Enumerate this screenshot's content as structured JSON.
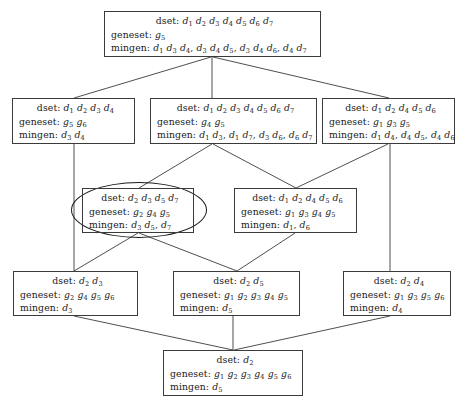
{
  "diagram": {
    "labels": {
      "dset": "dset:",
      "geneset": "geneset:",
      "mingen": "mingen:"
    },
    "stroke_color": "#3b3b3b",
    "highlight_color": "#1a1a1a",
    "background_color": "#ffffff"
  },
  "nodes": [
    {
      "id": "n0",
      "name": "node-top",
      "x": 104,
      "y": 11,
      "w": 217,
      "h": 46,
      "dset": "d1 d2 d3 d4 d5 d6 d7",
      "geneset": "g5",
      "mingen": "d1 d3 d4, d3 d4 d5, d3 d4 d6, d4 d7",
      "highlighted": false
    },
    {
      "id": "n1",
      "name": "node-row2-left",
      "x": 12,
      "y": 98,
      "w": 123,
      "h": 46,
      "dset": "d1 d2 d3 d4",
      "geneset": "g5 g6",
      "mingen": "d3 d4",
      "highlighted": false
    },
    {
      "id": "n2",
      "name": "node-row2-middle",
      "x": 150,
      "y": 98,
      "w": 167,
      "h": 46,
      "dset": "d1 d2 d3 d4 d5 d6 d7",
      "geneset": "g4 g5",
      "mingen": "d1 d3, d1 d7, d3 d6, d6 d7",
      "highlighted": false
    },
    {
      "id": "n3",
      "name": "node-row2-right",
      "x": 322,
      "y": 98,
      "w": 133,
      "h": 46,
      "dset": "d1 d2 d4 d5 d6",
      "geneset": "g1 g3 g5",
      "mingen": "d1 d4, d4 d5, d4 d6",
      "highlighted": false
    },
    {
      "id": "n4",
      "name": "node-row3-left-highlighted",
      "x": 82,
      "y": 188,
      "w": 112,
      "h": 45,
      "dset": "d2 d3 d5 d7",
      "geneset": "g2 g4 g5",
      "mingen": "d3 d5, d7",
      "highlighted": true
    },
    {
      "id": "n5",
      "name": "node-row3-right",
      "x": 234,
      "y": 188,
      "w": 123,
      "h": 45,
      "dset": "d1 d2 d4 d5 d6",
      "geneset": "g1 g3 g4 g5",
      "mingen": "d1, d6",
      "highlighted": false
    },
    {
      "id": "n6",
      "name": "node-row4-left",
      "x": 13,
      "y": 271,
      "w": 125,
      "h": 45,
      "dset": "d2 d3",
      "geneset": "g2 g4 g5 g6",
      "mingen": "d3",
      "highlighted": false
    },
    {
      "id": "n7",
      "name": "node-row4-middle",
      "x": 173,
      "y": 271,
      "w": 127,
      "h": 45,
      "dset": "d2 d5",
      "geneset": "g1 g2 g3 g4 g5",
      "mingen": "d5",
      "highlighted": false
    },
    {
      "id": "n8",
      "name": "node-row4-right",
      "x": 343,
      "y": 271,
      "w": 108,
      "h": 45,
      "dset": "d2 d4",
      "geneset": "g1 g3 g5 g6",
      "mingen": "d4",
      "highlighted": false
    },
    {
      "id": "n9",
      "name": "node-bottom",
      "x": 163,
      "y": 350,
      "w": 140,
      "h": 46,
      "dset": "d2",
      "geneset": "g1 g2 g3 g4 g5 g6",
      "mingen": "d5",
      "highlighted": false
    }
  ],
  "edges": [
    {
      "name": "edge-top-to-row2-left",
      "x1": 211,
      "y1": 57,
      "x2": 74,
      "y2": 98
    },
    {
      "name": "edge-top-to-row2-middle",
      "x1": 212,
      "y1": 57,
      "x2": 212,
      "y2": 98
    },
    {
      "name": "edge-top-to-row2-right",
      "x1": 213,
      "y1": 57,
      "x2": 389,
      "y2": 98
    },
    {
      "name": "edge-row2left-to-row4left",
      "x1": 74,
      "y1": 144,
      "x2": 74,
      "y2": 271
    },
    {
      "name": "edge-row2mid-to-highlight",
      "x1": 212,
      "y1": 144,
      "x2": 139,
      "y2": 188
    },
    {
      "name": "edge-row2mid-to-row3right",
      "x1": 213,
      "y1": 144,
      "x2": 296,
      "y2": 188
    },
    {
      "name": "edge-row2right-to-row3right",
      "x1": 388,
      "y1": 144,
      "x2": 296,
      "y2": 188
    },
    {
      "name": "edge-row2right-to-row4right",
      "x1": 390,
      "y1": 144,
      "x2": 390,
      "y2": 271
    },
    {
      "name": "edge-highlight-to-row4left",
      "x1": 138,
      "y1": 233,
      "x2": 74,
      "y2": 271
    },
    {
      "name": "edge-highlight-to-row4mid",
      "x1": 139,
      "y1": 233,
      "x2": 237,
      "y2": 271
    },
    {
      "name": "edge-row3right-to-row4mid",
      "x1": 295,
      "y1": 233,
      "x2": 237,
      "y2": 271
    },
    {
      "name": "edge-row4left-to-bottom",
      "x1": 74,
      "y1": 316,
      "x2": 233,
      "y2": 350
    },
    {
      "name": "edge-row4mid-to-bottom",
      "x1": 233,
      "y1": 316,
      "x2": 233,
      "y2": 350
    },
    {
      "name": "edge-row4right-to-bottom",
      "x1": 390,
      "y1": 316,
      "x2": 234,
      "y2": 350
    }
  ],
  "highlight_ellipse": {
    "name": "highlight-ellipse",
    "x": 71,
    "y": 182,
    "w": 134,
    "h": 54
  }
}
